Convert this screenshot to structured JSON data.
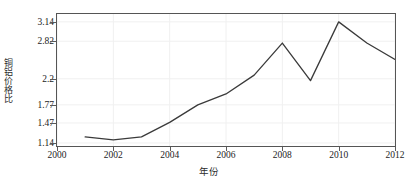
{
  "chart_data": {
    "type": "line",
    "title": "",
    "subtitle": "",
    "xlabel": "年份",
    "ylabel": "铜铝价格比",
    "x": [
      2001,
      2002,
      2003,
      2004,
      2005,
      2006,
      2007,
      2008,
      2009,
      2010,
      2011,
      2012
    ],
    "values": [
      1.24,
      1.19,
      1.24,
      1.48,
      1.77,
      1.95,
      2.26,
      2.79,
      2.17,
      3.14,
      2.79,
      2.52
    ],
    "series": [
      {
        "name": "铜铝价格比",
        "values": [
          1.24,
          1.19,
          1.24,
          1.48,
          1.77,
          1.95,
          2.26,
          2.79,
          2.17,
          3.14,
          2.79,
          2.52
        ]
      }
    ],
    "xlim": [
      2000,
      2012
    ],
    "ylim": [
      1.09,
      3.27
    ],
    "xticks": [
      "2000",
      "2002",
      "2004",
      "2006",
      "2008",
      "2010",
      "2012"
    ],
    "xtick_values": [
      2000,
      2002,
      2004,
      2006,
      2008,
      2010,
      2012
    ],
    "yticks": [
      "1.14",
      "1.47",
      "1.77",
      "2.2",
      "2.82",
      "3.14"
    ],
    "ytick_values": [
      1.14,
      1.47,
      1.77,
      2.2,
      2.82,
      3.14
    ],
    "grid": true,
    "grid_color": "#f0f0f0",
    "line_color": "#3a3a3a",
    "legend": null,
    "legend_position": "none",
    "markers": false,
    "annotations": []
  }
}
